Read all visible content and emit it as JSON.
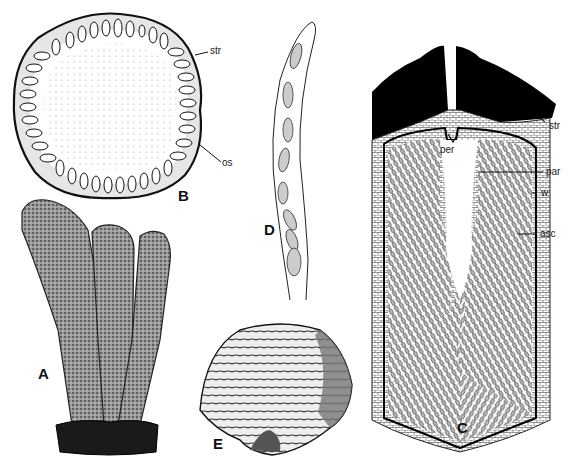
{
  "figure": {
    "panels": [
      {
        "id": "A",
        "label": "A",
        "subject": "cluster of club-shaped fruiting bodies on substrate"
      },
      {
        "id": "B",
        "label": "B",
        "subject": "cross-section of stroma with ring of perithecia"
      },
      {
        "id": "C",
        "label": "C",
        "subject": "longitudinal section of a perithecium"
      },
      {
        "id": "D",
        "label": "D",
        "subject": "ascus with eight ascospores"
      },
      {
        "id": "E",
        "label": "E",
        "subject": "fan-shaped zonate fruiting body"
      }
    ],
    "annotations": {
      "B": [
        {
          "text": "str"
        },
        {
          "text": "os"
        }
      ],
      "C": [
        {
          "text": "per"
        },
        {
          "text": "str"
        },
        {
          "text": "par"
        },
        {
          "text": "w"
        },
        {
          "text": "asc"
        }
      ]
    },
    "colors": {
      "ink": "#111111",
      "background": "#ffffff",
      "shade": "#8a8a8a"
    }
  }
}
